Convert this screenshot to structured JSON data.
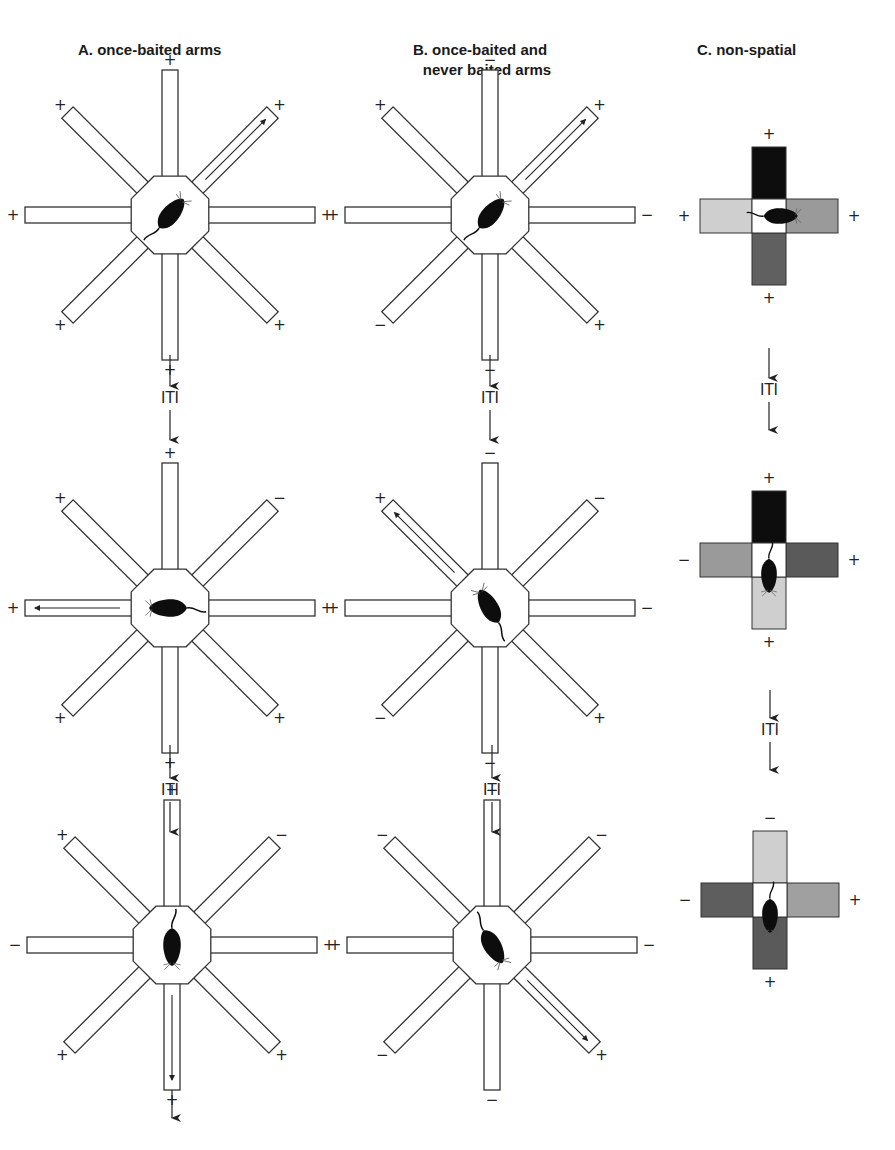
{
  "columns": [
    {
      "id": "A",
      "title": "A. once-baited arms"
    },
    {
      "id": "B",
      "title_line1": "B. once-baited and",
      "title_line2": "never baited arms"
    },
    {
      "id": "C",
      "title": "C. non-spatial"
    }
  ],
  "iti_label": "ITI",
  "arm_order_note": "arms listed clockwise from top: N, NE, E, SE, S, SW, W, NW",
  "radial_mazes": [
    {
      "column": "A",
      "trial": 1,
      "cx": 170,
      "cy": 215,
      "signs": [
        "+",
        "+",
        "+",
        "+",
        "+",
        "+",
        "+",
        "+"
      ],
      "chosen_arm": "NE",
      "rat_heading_deg": 40
    },
    {
      "column": "A",
      "trial": 2,
      "cx": 170,
      "cy": 608,
      "signs": [
        "+",
        "−",
        "+",
        "+",
        "+",
        "+",
        "+",
        "+"
      ],
      "chosen_arm": "W",
      "rat_heading_deg": 270
    },
    {
      "column": "A",
      "trial": 3,
      "cx": 172,
      "cy": 945,
      "signs": [
        "+",
        "−",
        "+",
        "+",
        "+",
        "+",
        "−",
        "+"
      ],
      "chosen_arm": "S",
      "rat_heading_deg": 180
    },
    {
      "column": "B",
      "trial": 1,
      "cx": 490,
      "cy": 215,
      "signs": [
        "−",
        "+",
        "−",
        "+",
        "−",
        "−",
        "+",
        "+"
      ],
      "chosen_arm": "NE",
      "rat_heading_deg": 40
    },
    {
      "column": "B",
      "trial": 2,
      "cx": 490,
      "cy": 608,
      "signs": [
        "−",
        "−",
        "−",
        "+",
        "−",
        "−",
        "+",
        "+"
      ],
      "chosen_arm": "NW",
      "rat_heading_deg": 330
    },
    {
      "column": "B",
      "trial": 3,
      "cx": 492,
      "cy": 945,
      "signs": [
        "−",
        "−",
        "−",
        "+",
        "−",
        "−",
        "+",
        "−"
      ],
      "chosen_arm": "SE",
      "rat_heading_deg": 150
    }
  ],
  "cross_mazes": [
    {
      "column": "C",
      "trial": 1,
      "cx": 769,
      "cy": 216,
      "arms": {
        "N": {
          "sign": "+",
          "color": "#0d0d0d"
        },
        "E": {
          "sign": "+",
          "color": "#9a9a9a"
        },
        "S": {
          "sign": "+",
          "color": "#606060"
        },
        "W": {
          "sign": "+",
          "color": "#cfcfcf"
        }
      },
      "rat_heading_deg": 90
    },
    {
      "column": "C",
      "trial": 2,
      "cx": 769,
      "cy": 560,
      "arms": {
        "N": {
          "sign": "+",
          "color": "#0d0d0d"
        },
        "E": {
          "sign": "+",
          "color": "#5a5a5a"
        },
        "S": {
          "sign": "+",
          "color": "#cfcfcf"
        },
        "W": {
          "sign": "−",
          "color": "#9a9a9a"
        }
      },
      "rat_heading_deg": 180
    },
    {
      "column": "C",
      "trial": 3,
      "cx": 770,
      "cy": 900,
      "arms": {
        "N": {
          "sign": "−",
          "color": "#cfcfcf"
        },
        "E": {
          "sign": "+",
          "color": "#a0a0a0"
        },
        "S": {
          "sign": "+",
          "color": "#5a5a5a"
        },
        "W": {
          "sign": "−",
          "color": "#5e5e5e"
        }
      },
      "rat_heading_deg": 180
    }
  ],
  "iti_connectors": [
    {
      "column": "A",
      "x": 170,
      "y_top": 355,
      "iti_y": 398,
      "y_bottom": 440
    },
    {
      "column": "A",
      "x": 170,
      "y_top": 745,
      "iti_y": 790,
      "y_bottom": 832
    },
    {
      "column": "A",
      "x": 172,
      "y_top": 1090,
      "iti_y": null,
      "y_bottom": 1118
    },
    {
      "column": "B",
      "x": 490,
      "y_top": 355,
      "iti_y": 398,
      "y_bottom": 440
    },
    {
      "column": "B",
      "x": 492,
      "y_top": 745,
      "iti_y": 790,
      "y_bottom": 832
    },
    {
      "column": "C",
      "x": 769,
      "y_top": 348,
      "iti_y": 390,
      "y_bottom": 430
    },
    {
      "column": "C",
      "x": 770,
      "y_top": 690,
      "iti_y": 730,
      "y_bottom": 770
    }
  ],
  "colors": {
    "line": "#333333",
    "rat": "#0d0d0d",
    "background": "#ffffff"
  }
}
